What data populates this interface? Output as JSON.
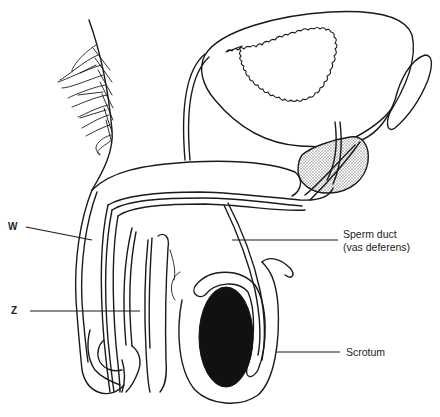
{
  "diagram": {
    "type": "anatomical-line-drawing",
    "labels": {
      "w": "W",
      "z": "Z",
      "sperm_duct_line1": "Sperm duct",
      "sperm_duct_line2": "(vas deferens)",
      "scrotum": "Scrotum"
    },
    "colors": {
      "stroke": "#1a1a1a",
      "testis_fill": "#111111",
      "gland_stipple": "#9a9a9a",
      "background": "#ffffff"
    }
  }
}
